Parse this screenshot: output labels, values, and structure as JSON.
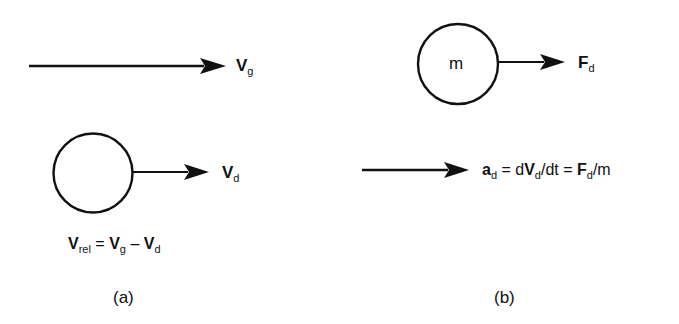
{
  "diagram": {
    "panel_a": {
      "caption": "(a)",
      "gas_velocity": {
        "symbol": "V",
        "subscript": "g"
      },
      "droplet_velocity": {
        "symbol": "V",
        "subscript": "d"
      },
      "relative_velocity_equation": {
        "lhs_symbol": "V",
        "lhs_subscript": "rel",
        "equals": "=",
        "term1_symbol": "V",
        "term1_subscript": "g",
        "minus": "–",
        "term2_symbol": "V",
        "term2_subscript": "d"
      }
    },
    "panel_b": {
      "caption": "(b)",
      "mass_label": "m",
      "drag_force": {
        "symbol": "F",
        "subscript": "d"
      },
      "acceleration_equation": {
        "a_symbol": "a",
        "a_subscript": "d",
        "eq1": " = d",
        "v_symbol": "V",
        "v_subscript": "d",
        "mid": "/dt = ",
        "f_symbol": "F",
        "f_subscript": "d",
        "tail": "/m"
      }
    },
    "colors": {
      "stroke": "#111111",
      "background": "#ffffff"
    }
  }
}
